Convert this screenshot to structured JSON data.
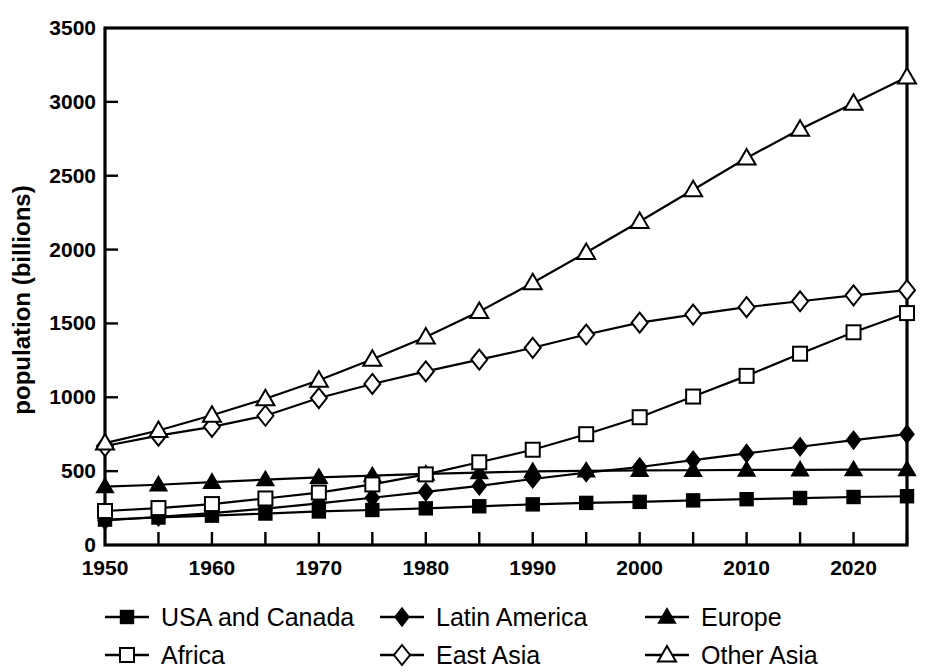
{
  "chart_data": {
    "type": "line",
    "title": "",
    "subtitle": "",
    "xlabel": "",
    "ylabel": "population (billions)",
    "xlim": [
      1950,
      2025
    ],
    "ylim": [
      0,
      3500
    ],
    "x": [
      1950,
      1955,
      1960,
      1965,
      1970,
      1975,
      1980,
      1985,
      1990,
      1995,
      2000,
      2005,
      2010,
      2015,
      2020,
      2025
    ],
    "x_tick_labels": [
      "1950",
      "",
      "1960",
      "",
      "1970",
      "",
      "1980",
      "",
      "1990",
      "",
      "2000",
      "",
      "2010",
      "",
      "2020",
      ""
    ],
    "x_ticks_major": [
      1950,
      1960,
      1970,
      1980,
      1990,
      2000,
      2010,
      2020
    ],
    "x_ticks_minor": [
      1955,
      1965,
      1975,
      1985,
      1995,
      2005,
      2015,
      2025
    ],
    "y_ticks": [
      0,
      500,
      1000,
      1500,
      2000,
      2500,
      3000,
      3500
    ],
    "y_tick_labels": [
      "0",
      "500",
      "1000",
      "1500",
      "2000",
      "2500",
      "3000",
      "3500"
    ],
    "grid": false,
    "legend_position": "below",
    "legend_columns": 3,
    "series": [
      {
        "name": "USA and Canada",
        "marker": "square-filled",
        "values": [
          172,
          186,
          199,
          213,
          227,
          237,
          248,
          262,
          275,
          285,
          292,
          302,
          310,
          318,
          325,
          330
        ]
      },
      {
        "name": "Latin America",
        "marker": "diamond-filled",
        "values": [
          166,
          190,
          216,
          246,
          282,
          320,
          360,
          400,
          447,
          490,
          528,
          575,
          620,
          665,
          710,
          750
        ]
      },
      {
        "name": "Europe",
        "marker": "triangle-filled",
        "values": [
          395,
          408,
          425,
          443,
          458,
          470,
          481,
          490,
          498,
          502,
          505,
          506,
          508,
          509,
          510,
          510
        ]
      },
      {
        "name": "Africa",
        "marker": "square-open",
        "values": [
          230,
          250,
          277,
          315,
          355,
          410,
          478,
          560,
          645,
          750,
          865,
          1005,
          1145,
          1295,
          1440,
          1570
        ]
      },
      {
        "name": "East Asia",
        "marker": "diamond-open",
        "values": [
          670,
          740,
          800,
          875,
          995,
          1090,
          1175,
          1255,
          1335,
          1425,
          1505,
          1560,
          1610,
          1650,
          1690,
          1725
        ]
      },
      {
        "name": "Other Asia",
        "marker": "triangle-open",
        "values": [
          690,
          775,
          878,
          990,
          1115,
          1258,
          1408,
          1580,
          1775,
          1980,
          2190,
          2405,
          2620,
          2815,
          2990,
          3168
        ]
      }
    ]
  },
  "axis": {
    "y_title": "population (billions)"
  },
  "legend": {
    "entries": [
      {
        "label": "USA and Canada",
        "marker": "square-filled"
      },
      {
        "label": "Latin America",
        "marker": "diamond-filled"
      },
      {
        "label": "Europe",
        "marker": "triangle-filled"
      },
      {
        "label": "Africa",
        "marker": "square-open"
      },
      {
        "label": "East Asia",
        "marker": "diamond-open"
      },
      {
        "label": "Other Asia",
        "marker": "triangle-open"
      }
    ]
  },
  "colors": {
    "ink": "#000000",
    "paper": "#ffffff"
  }
}
